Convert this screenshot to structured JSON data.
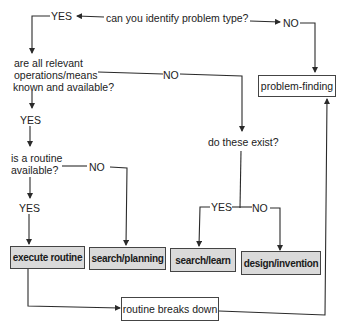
{
  "diagram": {
    "type": "flowchart",
    "questions": {
      "identify": "can you identify problem type?",
      "relevant_line1": "are all relevant",
      "relevant_line2": "operations/means",
      "relevant_line3": "known and available?",
      "exist": "do these exist?",
      "routine_line1": "is a routine",
      "routine_line2": "available?"
    },
    "branch_labels": {
      "identify_yes": "YES",
      "identify_no": "NO",
      "relevant_no": "NO",
      "relevant_yes": "YES",
      "routine_no": "NO",
      "routine_yes": "YES",
      "exist_yes": "YES",
      "exist_no": "NO"
    },
    "outcomes": {
      "problem_finding": "problem-finding",
      "execute_routine": "execute routine",
      "search_planning": "search/planning",
      "search_learn": "search/learn",
      "design_invention": "design/invention",
      "routine_breaks_down": "routine breaks down"
    },
    "colors": {
      "line": "#2a2a2a",
      "outcome_fill": "#dadada",
      "background": "#ffffff"
    }
  }
}
